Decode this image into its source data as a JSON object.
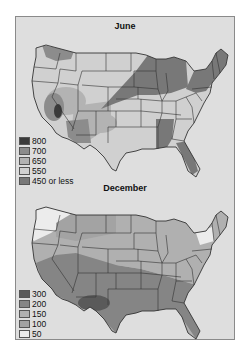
{
  "maps": [
    {
      "title": "June",
      "legend": [
        {
          "label": "800",
          "color": "#3a3a3a"
        },
        {
          "label": "700",
          "color": "#8c8c8c"
        },
        {
          "label": "650",
          "color": "#b3b3b3"
        },
        {
          "label": "550",
          "color": "#d0d0d0"
        },
        {
          "label": "450 or less",
          "color": "#787878"
        }
      ]
    },
    {
      "title": "December",
      "legend": [
        {
          "label": "300",
          "color": "#5a5a5a"
        },
        {
          "label": "200",
          "color": "#858585"
        },
        {
          "label": "150",
          "color": "#b0b0b0"
        },
        {
          "label": "100",
          "color": "#a3a3a3"
        },
        {
          "label": "50",
          "color": "#ececec"
        }
      ]
    }
  ]
}
